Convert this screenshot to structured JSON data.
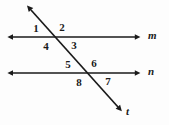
{
  "figure": {
    "type": "geometry-diagram",
    "background_color": "#fdfdfd",
    "stroke_color": "#1a1a1a",
    "width": 169,
    "height": 125
  },
  "lines": [
    {
      "id": "line-m",
      "label": "m",
      "orientation": "horizontal",
      "x1": 8,
      "y1": 37,
      "x2": 140,
      "y2": 37,
      "arrow_start": true,
      "arrow_end": true,
      "label_x": 148,
      "label_y": 31
    },
    {
      "id": "line-n",
      "label": "n",
      "orientation": "horizontal",
      "x1": 8,
      "y1": 73,
      "x2": 140,
      "y2": 73,
      "arrow_start": true,
      "arrow_end": true,
      "label_x": 148,
      "label_y": 67
    },
    {
      "id": "line-t",
      "label": "t",
      "orientation": "transversal",
      "x1": 27,
      "y1": 6,
      "x2": 122,
      "y2": 112,
      "arrow_start": true,
      "arrow_end": true,
      "label_x": 126,
      "label_y": 108
    }
  ],
  "intersections": [
    {
      "id": "upper-intersection",
      "line": "m",
      "x": 60,
      "y": 37
    },
    {
      "id": "lower-intersection",
      "line": "n",
      "x": 92,
      "y": 73
    }
  ],
  "angles": [
    {
      "id": "angle-1",
      "label": "1",
      "x": 36,
      "y": 23,
      "position": "upper-left-above-m"
    },
    {
      "id": "angle-2",
      "label": "2",
      "x": 62,
      "y": 22,
      "position": "upper-right-above-m"
    },
    {
      "id": "angle-3",
      "label": "3",
      "x": 74,
      "y": 40,
      "position": "upper-right-below-m"
    },
    {
      "id": "angle-4",
      "label": "4",
      "x": 46,
      "y": 41,
      "position": "upper-left-below-m"
    },
    {
      "id": "angle-5",
      "label": "5",
      "x": 68,
      "y": 59,
      "position": "lower-left-above-n"
    },
    {
      "id": "angle-6",
      "label": "6",
      "x": 94,
      "y": 58,
      "position": "lower-right-above-n"
    },
    {
      "id": "angle-7",
      "label": "7",
      "x": 108,
      "y": 76,
      "position": "lower-right-below-n"
    },
    {
      "id": "angle-8",
      "label": "8",
      "x": 79,
      "y": 77,
      "position": "lower-left-below-n"
    }
  ]
}
